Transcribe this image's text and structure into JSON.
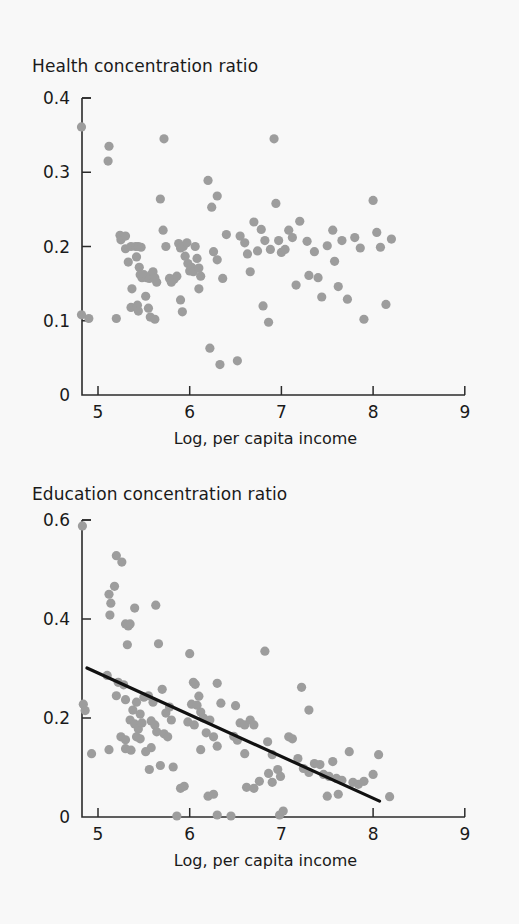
{
  "figure": {
    "background_color": "#f8f8f8",
    "point_color": "#9d9d9d",
    "axis_color": "#2b2b2b",
    "trend_color": "#111111"
  },
  "chart_data": [
    {
      "type": "scatter",
      "id": "health",
      "title": "Health concentration ratio",
      "xlabel": "Log, per capita income",
      "ylabel": "",
      "xlim": [
        4.65,
        9.0
      ],
      "ylim": [
        0,
        0.4
      ],
      "xticks": [
        5,
        6,
        7,
        8,
        9
      ],
      "xtick_labels": [
        "5",
        "6",
        "7",
        "8",
        "9"
      ],
      "yticks": [
        0,
        0.1,
        0.2,
        0.3,
        0.4
      ],
      "ytick_labels": [
        "0",
        "0.1",
        "0.2",
        "0.3",
        "0.4"
      ],
      "grid": false,
      "legend": false,
      "trend_line": null,
      "points": [
        [
          4.82,
          0.361
        ],
        [
          4.82,
          0.108
        ],
        [
          4.9,
          0.103
        ],
        [
          5.12,
          0.335
        ],
        [
          5.11,
          0.315
        ],
        [
          5.2,
          0.103
        ],
        [
          5.24,
          0.215
        ],
        [
          5.25,
          0.209
        ],
        [
          5.3,
          0.214
        ],
        [
          5.3,
          0.197
        ],
        [
          5.33,
          0.179
        ],
        [
          5.36,
          0.2
        ],
        [
          5.41,
          0.2
        ],
        [
          5.44,
          0.2
        ],
        [
          5.47,
          0.199
        ],
        [
          5.42,
          0.186
        ],
        [
          5.45,
          0.172
        ],
        [
          5.46,
          0.162
        ],
        [
          5.48,
          0.158
        ],
        [
          5.5,
          0.162
        ],
        [
          5.53,
          0.158
        ],
        [
          5.56,
          0.157
        ],
        [
          5.58,
          0.162
        ],
        [
          5.6,
          0.166
        ],
        [
          5.62,
          0.158
        ],
        [
          5.64,
          0.152
        ],
        [
          5.37,
          0.143
        ],
        [
          5.36,
          0.118
        ],
        [
          5.43,
          0.121
        ],
        [
          5.44,
          0.113
        ],
        [
          5.52,
          0.133
        ],
        [
          5.55,
          0.117
        ],
        [
          5.57,
          0.105
        ],
        [
          5.72,
          0.345
        ],
        [
          5.68,
          0.264
        ],
        [
          5.71,
          0.222
        ],
        [
          5.74,
          0.2
        ],
        [
          5.78,
          0.157
        ],
        [
          5.8,
          0.152
        ],
        [
          5.83,
          0.156
        ],
        [
          5.86,
          0.16
        ],
        [
          5.62,
          0.102
        ],
        [
          5.88,
          0.204
        ],
        [
          5.9,
          0.198
        ],
        [
          5.93,
          0.2
        ],
        [
          5.97,
          0.205
        ],
        [
          5.95,
          0.187
        ],
        [
          5.98,
          0.177
        ],
        [
          6.0,
          0.167
        ],
        [
          6.02,
          0.172
        ],
        [
          6.04,
          0.166
        ],
        [
          5.9,
          0.128
        ],
        [
          5.92,
          0.112
        ],
        [
          6.06,
          0.2
        ],
        [
          6.08,
          0.184
        ],
        [
          6.1,
          0.171
        ],
        [
          6.12,
          0.16
        ],
        [
          6.1,
          0.143
        ],
        [
          6.2,
          0.289
        ],
        [
          6.3,
          0.268
        ],
        [
          6.24,
          0.253
        ],
        [
          6.26,
          0.193
        ],
        [
          6.3,
          0.182
        ],
        [
          6.36,
          0.157
        ],
        [
          6.4,
          0.216
        ],
        [
          6.22,
          0.063
        ],
        [
          6.33,
          0.041
        ],
        [
          6.52,
          0.046
        ],
        [
          6.55,
          0.214
        ],
        [
          6.6,
          0.205
        ],
        [
          6.63,
          0.19
        ],
        [
          6.66,
          0.166
        ],
        [
          6.7,
          0.233
        ],
        [
          6.74,
          0.194
        ],
        [
          6.78,
          0.223
        ],
        [
          6.82,
          0.208
        ],
        [
          6.88,
          0.196
        ],
        [
          6.92,
          0.345
        ],
        [
          6.94,
          0.258
        ],
        [
          6.97,
          0.208
        ],
        [
          7.0,
          0.192
        ],
        [
          7.04,
          0.196
        ],
        [
          7.08,
          0.222
        ],
        [
          7.12,
          0.212
        ],
        [
          7.2,
          0.234
        ],
        [
          6.8,
          0.12
        ],
        [
          6.86,
          0.098
        ],
        [
          7.16,
          0.148
        ],
        [
          7.28,
          0.207
        ],
        [
          7.3,
          0.161
        ],
        [
          7.36,
          0.193
        ],
        [
          7.4,
          0.158
        ],
        [
          7.44,
          0.132
        ],
        [
          7.5,
          0.201
        ],
        [
          7.56,
          0.222
        ],
        [
          7.58,
          0.18
        ],
        [
          7.62,
          0.146
        ],
        [
          7.66,
          0.208
        ],
        [
          7.72,
          0.129
        ],
        [
          7.8,
          0.212
        ],
        [
          7.86,
          0.198
        ],
        [
          8.0,
          0.262
        ],
        [
          8.04,
          0.219
        ],
        [
          8.08,
          0.199
        ],
        [
          8.14,
          0.122
        ],
        [
          7.9,
          0.102
        ],
        [
          8.2,
          0.21
        ]
      ]
    },
    {
      "type": "scatter",
      "id": "education",
      "title": "Education concentration ratio",
      "xlabel": "Log, per capita income",
      "ylabel": "",
      "xlim": [
        4.65,
        9.0
      ],
      "ylim": [
        0,
        0.6
      ],
      "xticks": [
        5,
        6,
        7,
        8,
        9
      ],
      "xtick_labels": [
        "5",
        "6",
        "7",
        "8",
        "9"
      ],
      "yticks": [
        0,
        0.2,
        0.4,
        0.6
      ],
      "ytick_labels": [
        "0",
        "0.2",
        "0.4",
        "0.6"
      ],
      "grid": false,
      "legend": false,
      "trend_line": {
        "x1": 4.88,
        "y1": 0.301,
        "x2": 8.07,
        "y2": 0.032
      },
      "points": [
        [
          4.83,
          0.588
        ],
        [
          4.84,
          0.228
        ],
        [
          4.86,
          0.215
        ],
        [
          4.93,
          0.128
        ],
        [
          5.2,
          0.528
        ],
        [
          5.26,
          0.515
        ],
        [
          5.18,
          0.466
        ],
        [
          5.12,
          0.45
        ],
        [
          5.14,
          0.432
        ],
        [
          5.13,
          0.408
        ],
        [
          5.3,
          0.39
        ],
        [
          5.33,
          0.386
        ],
        [
          5.35,
          0.39
        ],
        [
          5.32,
          0.348
        ],
        [
          5.4,
          0.422
        ],
        [
          5.1,
          0.286
        ],
        [
          5.22,
          0.272
        ],
        [
          5.28,
          0.267
        ],
        [
          5.63,
          0.428
        ],
        [
          5.66,
          0.35
        ],
        [
          5.2,
          0.245
        ],
        [
          5.3,
          0.237
        ],
        [
          5.38,
          0.216
        ],
        [
          5.42,
          0.232
        ],
        [
          5.46,
          0.208
        ],
        [
          5.35,
          0.196
        ],
        [
          5.4,
          0.188
        ],
        [
          5.44,
          0.178
        ],
        [
          5.48,
          0.19
        ],
        [
          5.5,
          0.242
        ],
        [
          5.25,
          0.162
        ],
        [
          5.3,
          0.156
        ],
        [
          5.42,
          0.162
        ],
        [
          5.46,
          0.158
        ],
        [
          5.3,
          0.138
        ],
        [
          5.36,
          0.135
        ],
        [
          5.12,
          0.136
        ],
        [
          5.55,
          0.245
        ],
        [
          5.6,
          0.232
        ],
        [
          5.58,
          0.194
        ],
        [
          5.62,
          0.186
        ],
        [
          5.64,
          0.172
        ],
        [
          5.52,
          0.132
        ],
        [
          5.58,
          0.14
        ],
        [
          5.56,
          0.096
        ],
        [
          5.7,
          0.258
        ],
        [
          5.74,
          0.21
        ],
        [
          5.78,
          0.222
        ],
        [
          5.8,
          0.196
        ],
        [
          5.72,
          0.168
        ],
        [
          5.76,
          0.162
        ],
        [
          5.68,
          0.104
        ],
        [
          5.82,
          0.101
        ],
        [
          5.9,
          0.058
        ],
        [
          5.94,
          0.062
        ],
        [
          5.86,
          0.002
        ],
        [
          6.0,
          0.33
        ],
        [
          6.04,
          0.272
        ],
        [
          6.06,
          0.268
        ],
        [
          6.1,
          0.244
        ],
        [
          6.02,
          0.228
        ],
        [
          6.08,
          0.226
        ],
        [
          6.12,
          0.212
        ],
        [
          6.15,
          0.2
        ],
        [
          5.98,
          0.192
        ],
        [
          6.05,
          0.186
        ],
        [
          6.18,
          0.17
        ],
        [
          6.22,
          0.196
        ],
        [
          6.3,
          0.27
        ],
        [
          6.34,
          0.23
        ],
        [
          6.26,
          0.162
        ],
        [
          6.3,
          0.143
        ],
        [
          6.12,
          0.136
        ],
        [
          6.2,
          0.042
        ],
        [
          6.26,
          0.046
        ],
        [
          6.3,
          0.004
        ],
        [
          6.45,
          0.002
        ],
        [
          6.5,
          0.225
        ],
        [
          6.55,
          0.19
        ],
        [
          6.6,
          0.186
        ],
        [
          6.48,
          0.163
        ],
        [
          6.52,
          0.155
        ],
        [
          6.6,
          0.128
        ],
        [
          6.66,
          0.196
        ],
        [
          6.7,
          0.186
        ],
        [
          6.62,
          0.06
        ],
        [
          6.7,
          0.058
        ],
        [
          6.76,
          0.072
        ],
        [
          6.82,
          0.335
        ],
        [
          6.85,
          0.152
        ],
        [
          6.9,
          0.126
        ],
        [
          6.86,
          0.088
        ],
        [
          6.9,
          0.07
        ],
        [
          6.96,
          0.096
        ],
        [
          6.99,
          0.082
        ],
        [
          6.98,
          0.004
        ],
        [
          7.02,
          0.012
        ],
        [
          7.08,
          0.162
        ],
        [
          7.12,
          0.158
        ],
        [
          7.22,
          0.262
        ],
        [
          7.3,
          0.216
        ],
        [
          7.18,
          0.118
        ],
        [
          7.24,
          0.098
        ],
        [
          7.3,
          0.09
        ],
        [
          7.36,
          0.108
        ],
        [
          7.42,
          0.106
        ],
        [
          7.46,
          0.086
        ],
        [
          7.52,
          0.082
        ],
        [
          7.56,
          0.112
        ],
        [
          7.6,
          0.078
        ],
        [
          7.66,
          0.074
        ],
        [
          7.5,
          0.042
        ],
        [
          7.62,
          0.046
        ],
        [
          7.74,
          0.132
        ],
        [
          7.78,
          0.07
        ],
        [
          7.84,
          0.066
        ],
        [
          7.9,
          0.072
        ],
        [
          8.0,
          0.086
        ],
        [
          8.06,
          0.126
        ],
        [
          8.18,
          0.041
        ]
      ]
    }
  ]
}
